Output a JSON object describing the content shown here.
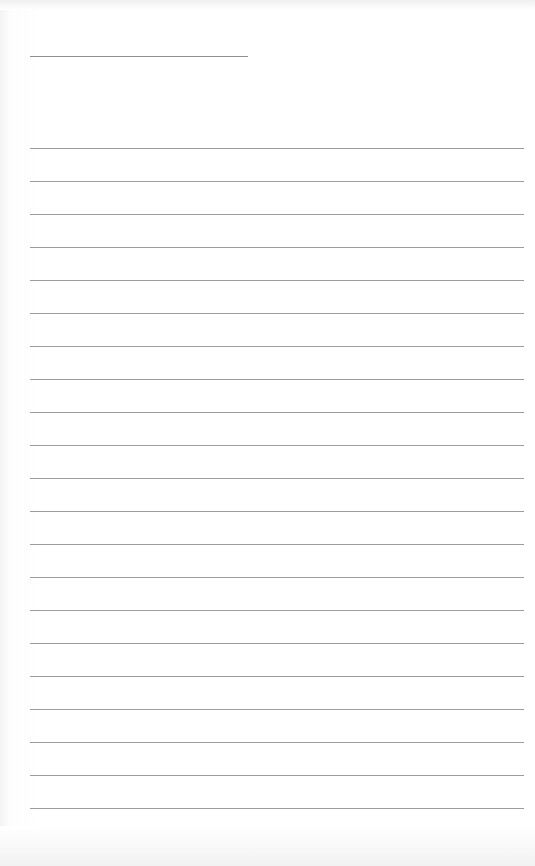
{
  "page": {
    "type": "lined-paper",
    "background_color": "#ffffff",
    "line_color": "#9c9c9c"
  },
  "header_line": {
    "x": 30,
    "y": 56,
    "width": 218
  },
  "ruled_lines": {
    "count": 21,
    "start_y": 148,
    "spacing": 33,
    "x": 30,
    "width": 494
  }
}
